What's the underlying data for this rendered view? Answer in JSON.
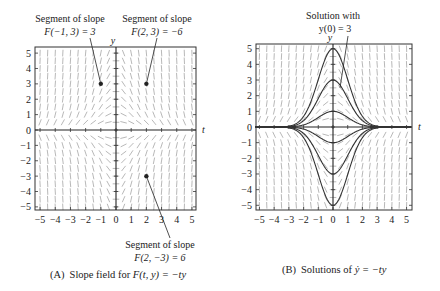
{
  "figure": {
    "panel_a": {
      "caption_prefix": "(A)",
      "caption_text": "Slope field for ",
      "caption_math": "F(t, y) = −ty",
      "axis_x_label": "t",
      "axis_y_label": "y",
      "annotations": [
        {
          "line1": "Segment of slope",
          "line2": "F(−1, 3) = 3",
          "point": [
            -1,
            3
          ]
        },
        {
          "line1": "Segment of slope",
          "line2": "F(2, 3) = −6",
          "point": [
            2,
            3
          ]
        },
        {
          "line1": "Segment of slope",
          "line2": "F(2, −3) = 6",
          "point": [
            2,
            -3
          ]
        }
      ]
    },
    "panel_b": {
      "caption_prefix": "(B)",
      "caption_text": "Solutions of ",
      "caption_math": "ẏ = −ty",
      "axis_x_label": "t",
      "axis_y_label": "y",
      "annotation": {
        "line1": "Solution with",
        "line2": "y(0) = 3"
      }
    },
    "x_ticks": [
      "−5",
      "−4",
      "−3",
      "−2",
      "−1",
      "0",
      "1",
      "2",
      "3",
      "4",
      "5"
    ],
    "y_ticks": [
      "5",
      "4",
      "3",
      "2",
      "1",
      "0",
      "−1",
      "−2",
      "−3",
      "−4",
      "−5"
    ]
  },
  "chart_data": [
    {
      "type": "slope_field",
      "title": "(A) Slope field for F(t, y) = −ty",
      "xlabel": "t",
      "ylabel": "y",
      "xlim": [
        -5.3,
        5.3
      ],
      "ylim": [
        -5.3,
        5.3
      ],
      "function": "F(t,y) = -t*y",
      "highlighted_points": [
        {
          "t": -1,
          "y": 3,
          "slope": 3
        },
        {
          "t": 2,
          "y": 3,
          "slope": -6
        },
        {
          "t": 2,
          "y": -3,
          "slope": 6
        }
      ]
    },
    {
      "type": "line",
      "title": "(B) Solutions of ẏ = −ty",
      "xlabel": "t",
      "ylabel": "y",
      "xlim": [
        -5.3,
        5.3
      ],
      "ylim": [
        -5.3,
        5.3
      ],
      "solution_formula": "y = y0 * exp(-t^2/2)",
      "series": [
        {
          "name": "y(0)=5",
          "y0": 5
        },
        {
          "name": "y(0)=3",
          "y0": 3
        },
        {
          "name": "y(0)=1",
          "y0": 1
        },
        {
          "name": "y(0)=-1",
          "y0": -1
        },
        {
          "name": "y(0)=-3",
          "y0": -3
        },
        {
          "name": "y(0)=-5",
          "y0": -5
        }
      ]
    }
  ]
}
